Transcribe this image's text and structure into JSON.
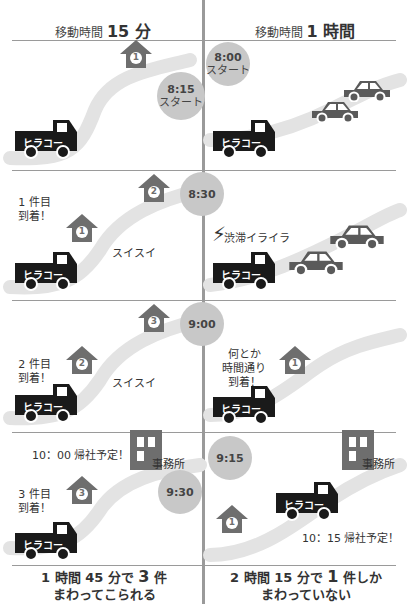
{
  "header": {
    "left": {
      "prefix": "移動時間",
      "value": "15 分"
    },
    "right": {
      "prefix": "移動時間",
      "value": "1 時間"
    }
  },
  "truck_label": "ヒラコー",
  "rows": [
    {
      "left": {
        "clock": "8:15",
        "clock_sub": "スタート",
        "houses": [
          "1"
        ]
      },
      "right": {
        "clock": "8:00",
        "clock_sub": "スタート",
        "cars": 2
      }
    },
    {
      "left": {
        "clock": "8:30",
        "houses": [
          "1",
          "2"
        ],
        "bubble": [
          "1 件目",
          "到着！"
        ],
        "label": "スイスイ"
      },
      "right": {
        "label": "渋滞イライラ",
        "cars": 2
      }
    },
    {
      "left": {
        "clock": "9:00",
        "houses": [
          "2",
          "3"
        ],
        "bubble": [
          "2 件目",
          "到着！"
        ],
        "label": "スイスイ"
      },
      "right": {
        "houses": [
          "1"
        ],
        "bubble": [
          "何とか",
          "時間通り",
          "到着！"
        ]
      }
    },
    {
      "left": {
        "clock": "9:30",
        "houses": [
          "3"
        ],
        "bubble": [
          "3 件目",
          "到着！"
        ],
        "note": "10：00 帰社予定！",
        "office": "事務所"
      },
      "right": {
        "clock": "9:15",
        "houses": [
          "1"
        ],
        "note": "10：15 帰社予定！",
        "office": "事務所"
      }
    }
  ],
  "footer": {
    "left": {
      "line1_a": "1 時間 45 分で ",
      "line1_b": "3",
      "line1_c": " 件",
      "line2": "まわってこられる"
    },
    "right": {
      "line1_a": "2 時間 15 分で ",
      "line1_b": "1",
      "line1_c": " 件しか",
      "line2": "まわっていない"
    }
  },
  "colors": {
    "truck": "#1a1a1a",
    "car": "#5a5a5a",
    "house": "#6e6e6e",
    "road": "#e3e3e3",
    "clock": "#c8c8c8",
    "office": "#6e6e6e",
    "line": "#9a9a9a"
  }
}
